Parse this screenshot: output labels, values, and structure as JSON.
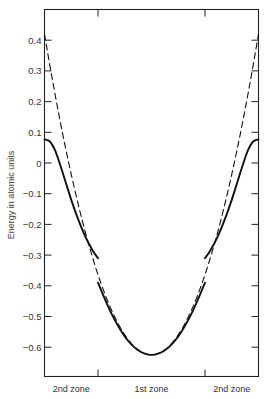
{
  "chart_data": {
    "type": "line",
    "title": "",
    "xlabel": "",
    "ylabel": "Energy in atomic units",
    "ylim": [
      -0.69,
      0.5
    ],
    "xlim": [
      -2,
      2
    ],
    "grid": false,
    "legend": null,
    "y_ticks": [
      0.4,
      0.3,
      0.2,
      0.1,
      0,
      -0.1,
      -0.2,
      -0.3,
      -0.4,
      -0.5,
      -0.6
    ],
    "y_tick_labels": [
      "0.4",
      "0.3",
      "0.2",
      "0.1",
      "0",
      "−0.1",
      "−0.2",
      "−0.3",
      "−0.4",
      "−0.5",
      "−0.6"
    ],
    "x_zone_boundaries": [
      -1,
      1
    ],
    "x_zone_labels": [
      {
        "label": "2nd zone",
        "x": -1.5
      },
      {
        "label": "1st zone",
        "x": 0
      },
      {
        "label": "2nd zone",
        "x": 1.5
      }
    ],
    "series": [
      {
        "name": "Free-electron parabola",
        "style": "dashed",
        "x": [
          -2,
          -1.75,
          -1.5,
          -1.25,
          -1,
          -0.5,
          0,
          0.5,
          1,
          1.25,
          1.5,
          1.75,
          2
        ],
        "values": [
          0.42,
          0.175,
          -0.04,
          -0.217,
          -0.364,
          -0.56,
          -0.625,
          -0.56,
          -0.364,
          -0.217,
          -0.04,
          0.175,
          0.42
        ]
      },
      {
        "name": "Band 1 (1st zone)",
        "style": "solid",
        "x": [
          -1,
          -0.75,
          -0.5,
          -0.25,
          0,
          0.25,
          0.5,
          0.75,
          1
        ],
        "values": [
          -0.39,
          -0.49,
          -0.565,
          -0.61,
          -0.625,
          -0.61,
          -0.565,
          -0.49,
          -0.39
        ]
      },
      {
        "name": "Band 2 (2nd zone, left)",
        "style": "solid",
        "x": [
          -2,
          -1.9,
          -1.8,
          -1.7,
          -1.6,
          -1.5,
          -1.4,
          -1.25,
          -1.1,
          -1
        ],
        "values": [
          0.077,
          0.07,
          0.04,
          -0.01,
          -0.065,
          -0.12,
          -0.17,
          -0.235,
          -0.285,
          -0.31
        ]
      },
      {
        "name": "Band 2 (2nd zone, right)",
        "style": "solid",
        "x": [
          1,
          1.1,
          1.25,
          1.4,
          1.5,
          1.6,
          1.7,
          1.8,
          1.9,
          2
        ],
        "values": [
          -0.31,
          -0.285,
          -0.235,
          -0.17,
          -0.12,
          -0.065,
          -0.01,
          0.04,
          0.07,
          0.077
        ]
      }
    ],
    "annotations": [
      {
        "text": "Energy gap at zone boundary",
        "from": -0.39,
        "to": -0.31
      }
    ]
  }
}
